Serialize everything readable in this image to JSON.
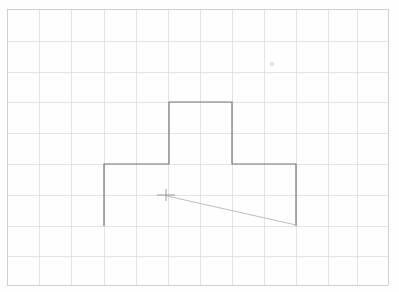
{
  "page": {
    "width": 399,
    "height": 292,
    "background_color": "#ffffff",
    "paper_tint": "#fdfdfd"
  },
  "grid": {
    "name": "graph-paper-grid",
    "line_color": "#d8d8dc",
    "border_color": "#c9c9cf",
    "line_width": 0.7,
    "border_width": 0.9,
    "cell_width_px": 32,
    "cell_height_px": 31,
    "columns": 12,
    "rows": 9,
    "x_positions": [
      7,
      39,
      71,
      104,
      136,
      168,
      200,
      232,
      264,
      296,
      328,
      357,
      388
    ],
    "y_positions": [
      9,
      41,
      72,
      102,
      133,
      164,
      195,
      226,
      256,
      285
    ],
    "left": 7,
    "right": 388,
    "top": 9,
    "bottom": 285
  },
  "drawing": {
    "name": "t-shape-outline",
    "stroke_color": "#76767c",
    "stroke_width": 1.2,
    "fill": "none",
    "description": "Open T-shaped / cross-shaped polyline outline drawn in pencil",
    "vertices": [
      {
        "label": "bottom-left-stem",
        "x": 104,
        "y": 226
      },
      {
        "label": "left-shoulder",
        "x": 104,
        "y": 164
      },
      {
        "label": "left-neck-base",
        "x": 169,
        "y": 164
      },
      {
        "label": "top-left",
        "x": 169,
        "y": 102
      },
      {
        "label": "top-right",
        "x": 232,
        "y": 102
      },
      {
        "label": "right-neck-base",
        "x": 232,
        "y": 164
      },
      {
        "label": "right-shoulder",
        "x": 296,
        "y": 164
      },
      {
        "label": "bottom-right-stem",
        "x": 296,
        "y": 226
      }
    ],
    "closed": false
  },
  "diagonal": {
    "name": "diagonal-construction-line",
    "stroke_color": "#b4b4ba",
    "stroke_width": 0.9,
    "start": {
      "x": 167,
      "y": 196
    },
    "end": {
      "x": 296,
      "y": 225
    }
  },
  "crosshair": {
    "name": "crosshair-mark",
    "stroke_color": "#8e8e96",
    "stroke_width": 0.9,
    "center_x": 166,
    "center_y": 195,
    "half_width": 9,
    "half_height": 6
  },
  "smudge": {
    "name": "paper-smudge-mark",
    "color": "#e2e2e6",
    "x": 272,
    "y": 64,
    "radius": 2.2
  }
}
